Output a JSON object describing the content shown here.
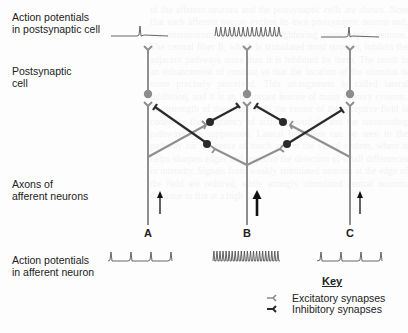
{
  "figure": {
    "labels": {
      "postsynaptic_ap": [
        "Action potentials",
        "in postsynaptic cell"
      ],
      "postsynaptic_cell": [
        "Postsynaptic",
        "cell"
      ],
      "afferent_axons": [
        "Axons of",
        "afferent neurons"
      ],
      "afferent_ap": [
        "Action potentials",
        "in afferent neuron"
      ]
    },
    "pathways": [
      {
        "id": "A",
        "label": "A",
        "x": 148,
        "afferent_spikes": 4,
        "postsynaptic_spikes": 1,
        "input_strength": "weak"
      },
      {
        "id": "B",
        "label": "B",
        "x": 247,
        "afferent_spikes": 22,
        "postsynaptic_spikes": 15,
        "input_strength": "strong"
      },
      {
        "id": "C",
        "label": "C",
        "x": 350,
        "afferent_spikes": 4,
        "postsynaptic_spikes": 1,
        "input_strength": "weak"
      }
    ],
    "key": {
      "title": "Key",
      "items": [
        {
          "symbol": "excitatory-synapse",
          "label": "Excitatory synapses",
          "color": "#8a8a8a"
        },
        {
          "symbol": "inhibitory-synapse",
          "label": "Inhibitory synapses",
          "color": "#2a2a2a"
        }
      ]
    },
    "colors": {
      "neuron_gray": "#8f8f8f",
      "inhibitory_black": "#2b2b2b",
      "trace": "#555555",
      "soma_gray": "#8c8c8c",
      "interneuron_soma": "#2a2a2a"
    }
  },
  "ghost_text": "of the afferent neurons and the postsynaptic cells are shown. Note that each afferent neuron excites its own postsynaptic neuron and, via interneurons, inhibits the neighboring postsynaptic neurons. The central fiber B, which is stimulated most strongly, inhibits the adjacent pathways more than it is inhibited by them. The result is an enhancement of contrast so that the location of the stimulus is more precisely perceived. This arrangement is called lateral inhibition, and it is an important feature of many sensory systems. The strength of the stimulus in the center of the receptive field is coded by the frequency of action potentials, and the surrounding pathways are suppressed. Lateral inhibition can be seen in the pathway for the sense of touch and in the visual system, where it helps sharpen edges and improve the detection of small differences in intensity. Signals from weakly stimulated neurons at the edge of the field are reduced, while strongly stimulated central neurons continue to fire at a high rate."
}
